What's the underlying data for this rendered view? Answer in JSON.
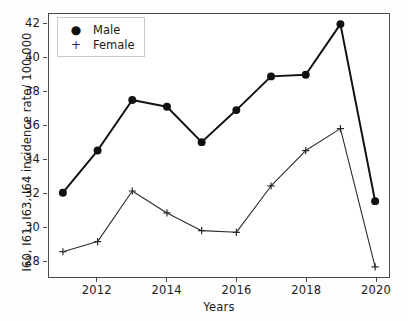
{
  "chart_data": {
    "type": "line",
    "title": "",
    "subtitle": "",
    "xlabel": "Years",
    "ylabel": "I60, I61, I63, I64 incidence rate/ 100,000",
    "x": [
      2011,
      2012,
      2013,
      2014,
      2015,
      2016,
      2017,
      2018,
      2019,
      2020
    ],
    "xlim": [
      2010.6,
      2020.4
    ],
    "ylim": [
      27.0,
      42.6
    ],
    "xticks": [
      2012,
      2014,
      2016,
      2018,
      2020
    ],
    "yticks": [
      28,
      30,
      32,
      34,
      36,
      38,
      40,
      42
    ],
    "xtick_labels": [
      "2012",
      "2014",
      "2016",
      "2018",
      "2020"
    ],
    "ytick_labels": [
      "28",
      "30",
      "32",
      "34",
      "36",
      "38",
      "40",
      "42"
    ],
    "grid": false,
    "legend_position": "upper left",
    "series": [
      {
        "name": "Male",
        "marker": "circle",
        "color": "#111111",
        "linewidth": 2.0,
        "values": [
          32.0,
          34.5,
          37.5,
          37.1,
          35.0,
          36.9,
          38.9,
          39.0,
          42.0,
          31.5
        ]
      },
      {
        "name": "Female",
        "marker": "plus",
        "color": "#2b2b2b",
        "linewidth": 1.1,
        "values": [
          28.5,
          29.1,
          32.1,
          30.8,
          29.75,
          29.65,
          32.4,
          34.5,
          35.8,
          27.6
        ]
      }
    ]
  },
  "legend": {
    "entries": [
      {
        "label": "Male",
        "marker_glyph": "●"
      },
      {
        "label": "Female",
        "marker_glyph": "+"
      }
    ]
  },
  "axes": {
    "xlabel": "Years",
    "ylabel": "I60, I61, I63, I64 incidence rate/ 100,000"
  }
}
